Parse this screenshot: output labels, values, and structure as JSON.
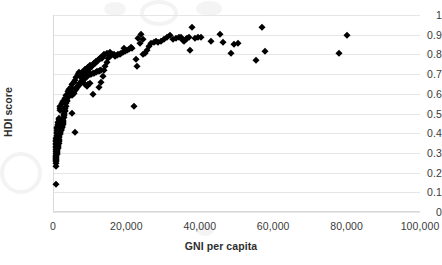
{
  "chart_data": {
    "type": "scatter",
    "title": "",
    "xlabel": "GNI per capita",
    "ylabel": "HDI score",
    "xlim": [
      0,
      100000
    ],
    "ylim": [
      0,
      1
    ],
    "xticks": [
      0,
      20000,
      40000,
      60000,
      80000,
      100000
    ],
    "xticklabels": [
      "0",
      "20,000",
      "40,000",
      "60,000",
      "80,000",
      "100,000"
    ],
    "yticks": [
      0,
      0.1,
      0.2,
      0.3,
      0.4,
      0.5,
      0.6,
      0.7,
      0.8,
      0.9,
      1
    ],
    "yticklabels": [
      "0",
      "0.1",
      "0.2",
      "0.3",
      "0.4",
      "0.5",
      "0.6",
      "0.7",
      "0.8",
      "0.9",
      "1"
    ],
    "grid": "horizontal",
    "legend": null,
    "marker": "diamond",
    "marker_color": "#000000",
    "series": [
      {
        "name": "Countries",
        "points": [
          [
            700,
            0.143
          ],
          [
            760,
            0.235
          ],
          [
            820,
            0.262
          ],
          [
            900,
            0.272
          ],
          [
            950,
            0.285
          ],
          [
            1000,
            0.295
          ],
          [
            1040,
            0.3
          ],
          [
            1080,
            0.305
          ],
          [
            1120,
            0.31
          ],
          [
            1180,
            0.315
          ],
          [
            1220,
            0.32
          ],
          [
            1260,
            0.325
          ],
          [
            1300,
            0.33
          ],
          [
            1350,
            0.333
          ],
          [
            1400,
            0.34
          ],
          [
            1450,
            0.345
          ],
          [
            1500,
            0.352
          ],
          [
            1550,
            0.358
          ],
          [
            1600,
            0.365
          ],
          [
            1650,
            0.372
          ],
          [
            1700,
            0.38
          ],
          [
            1750,
            0.388
          ],
          [
            1800,
            0.395
          ],
          [
            1850,
            0.4
          ],
          [
            1900,
            0.405
          ],
          [
            1950,
            0.408
          ],
          [
            2000,
            0.412
          ],
          [
            2050,
            0.415
          ],
          [
            2100,
            0.418
          ],
          [
            2150,
            0.42
          ],
          [
            2200,
            0.422
          ],
          [
            2250,
            0.425
          ],
          [
            2300,
            0.428
          ],
          [
            2350,
            0.43
          ],
          [
            2400,
            0.433
          ],
          [
            2450,
            0.436
          ],
          [
            2500,
            0.44
          ],
          [
            2550,
            0.444
          ],
          [
            2600,
            0.448
          ],
          [
            2650,
            0.452
          ],
          [
            2700,
            0.458
          ],
          [
            2750,
            0.462
          ],
          [
            2800,
            0.468
          ],
          [
            2850,
            0.475
          ],
          [
            2900,
            0.482
          ],
          [
            2950,
            0.49
          ],
          [
            3000,
            0.498
          ],
          [
            3100,
            0.505
          ],
          [
            3200,
            0.512
          ],
          [
            3300,
            0.52
          ],
          [
            5200,
            0.505
          ],
          [
            6100,
            0.404
          ],
          [
            3400,
            0.528
          ],
          [
            3500,
            0.54
          ],
          [
            3600,
            0.552
          ],
          [
            3700,
            0.562
          ],
          [
            3800,
            0.57
          ],
          [
            3900,
            0.578
          ],
          [
            4000,
            0.584
          ],
          [
            4100,
            0.59
          ],
          [
            4200,
            0.595
          ],
          [
            4300,
            0.6
          ],
          [
            4400,
            0.604
          ],
          [
            4500,
            0.608
          ],
          [
            4600,
            0.61
          ],
          [
            4700,
            0.612
          ],
          [
            4800,
            0.615
          ],
          [
            4900,
            0.618
          ],
          [
            5000,
            0.62
          ],
          [
            5200,
            0.595
          ],
          [
            5400,
            0.6
          ],
          [
            5600,
            0.605
          ],
          [
            5800,
            0.612
          ],
          [
            6000,
            0.618
          ],
          [
            6200,
            0.624
          ],
          [
            6400,
            0.63
          ],
          [
            6600,
            0.636
          ],
          [
            6800,
            0.64
          ],
          [
            7000,
            0.645
          ],
          [
            7200,
            0.65
          ],
          [
            7400,
            0.655
          ],
          [
            7600,
            0.66
          ],
          [
            7800,
            0.664
          ],
          [
            8000,
            0.668
          ],
          [
            8200,
            0.672
          ],
          [
            8400,
            0.676
          ],
          [
            8600,
            0.68
          ],
          [
            8800,
            0.684
          ],
          [
            9000,
            0.688
          ],
          [
            9200,
            0.69
          ],
          [
            9400,
            0.692
          ],
          [
            9600,
            0.695
          ],
          [
            9800,
            0.698
          ],
          [
            10000,
            0.7
          ],
          [
            10400,
            0.702
          ],
          [
            10800,
            0.705
          ],
          [
            11200,
            0.708
          ],
          [
            11600,
            0.712
          ],
          [
            12000,
            0.715
          ],
          [
            12400,
            0.718
          ],
          [
            12800,
            0.72
          ],
          [
            13200,
            0.722
          ],
          [
            11000,
            0.598
          ],
          [
            12600,
            0.635
          ],
          [
            13000,
            0.66
          ],
          [
            13600,
            0.69
          ],
          [
            9200,
            0.64
          ],
          [
            9600,
            0.648
          ],
          [
            10200,
            0.655
          ],
          [
            8600,
            0.65
          ],
          [
            7400,
            0.69
          ],
          [
            7800,
            0.7
          ],
          [
            8200,
            0.706
          ],
          [
            8600,
            0.712
          ],
          [
            9000,
            0.718
          ],
          [
            9400,
            0.722
          ],
          [
            9800,
            0.728
          ],
          [
            10200,
            0.735
          ],
          [
            10600,
            0.742
          ],
          [
            11000,
            0.75
          ],
          [
            11400,
            0.758
          ],
          [
            11800,
            0.764
          ],
          [
            12200,
            0.77
          ],
          [
            12600,
            0.775
          ],
          [
            13000,
            0.78
          ],
          [
            13400,
            0.784
          ],
          [
            13800,
            0.72
          ],
          [
            14200,
            0.74
          ],
          [
            14600,
            0.76
          ],
          [
            15000,
            0.78
          ],
          [
            15400,
            0.79
          ],
          [
            15800,
            0.795
          ],
          [
            16200,
            0.8
          ],
          [
            16600,
            0.802
          ],
          [
            17000,
            0.79
          ],
          [
            17400,
            0.795
          ],
          [
            17800,
            0.8
          ],
          [
            18200,
            0.804
          ],
          [
            18600,
            0.806
          ],
          [
            19000,
            0.81
          ],
          [
            19600,
            0.815
          ],
          [
            20200,
            0.82
          ],
          [
            20800,
            0.825
          ],
          [
            21400,
            0.83
          ],
          [
            22000,
            0.54
          ],
          [
            22600,
            0.775
          ],
          [
            23000,
            0.74
          ],
          [
            23600,
            0.86
          ],
          [
            24000,
            0.905
          ],
          [
            24600,
            0.8
          ],
          [
            25000,
            0.805
          ],
          [
            25600,
            0.82
          ],
          [
            26200,
            0.845
          ],
          [
            26800,
            0.86
          ],
          [
            27400,
            0.862
          ],
          [
            28000,
            0.866
          ],
          [
            28600,
            0.862
          ],
          [
            29400,
            0.87
          ],
          [
            30200,
            0.88
          ],
          [
            31000,
            0.89
          ],
          [
            31800,
            0.896
          ],
          [
            32600,
            0.878
          ],
          [
            33400,
            0.882
          ],
          [
            34200,
            0.886
          ],
          [
            35000,
            0.89
          ],
          [
            35400,
            0.874
          ],
          [
            35800,
            0.87
          ],
          [
            36200,
            0.876
          ],
          [
            36600,
            0.884
          ],
          [
            37000,
            0.888
          ],
          [
            37400,
            0.82
          ],
          [
            37800,
            0.94
          ],
          [
            38600,
            0.884
          ],
          [
            39400,
            0.89
          ],
          [
            40200,
            0.888
          ],
          [
            43000,
            0.866
          ],
          [
            45600,
            0.905
          ],
          [
            46400,
            0.862
          ],
          [
            48400,
            0.806
          ],
          [
            49400,
            0.852
          ],
          [
            50400,
            0.856
          ],
          [
            55400,
            0.774
          ],
          [
            57000,
            0.94
          ],
          [
            57800,
            0.816
          ],
          [
            78000,
            0.806
          ],
          [
            80200,
            0.896
          ],
          [
            21200,
            0.838
          ],
          [
            19400,
            0.83
          ],
          [
            23200,
            0.885
          ],
          [
            24400,
            0.88
          ],
          [
            6800,
            0.7
          ],
          [
            7200,
            0.712
          ],
          [
            6400,
            0.686
          ],
          [
            6000,
            0.672
          ],
          [
            5600,
            0.66
          ],
          [
            5200,
            0.648
          ],
          [
            4800,
            0.636
          ],
          [
            4400,
            0.624
          ],
          [
            4000,
            0.612
          ],
          [
            3600,
            0.594
          ],
          [
            3200,
            0.578
          ],
          [
            2800,
            0.562
          ],
          [
            2400,
            0.552
          ],
          [
            2000,
            0.54
          ],
          [
            1900,
            0.53
          ],
          [
            1800,
            0.52
          ],
          [
            1700,
            0.478
          ],
          [
            1600,
            0.47
          ],
          [
            1500,
            0.462
          ],
          [
            1400,
            0.455
          ],
          [
            1300,
            0.448
          ],
          [
            1250,
            0.44
          ],
          [
            1200,
            0.432
          ],
          [
            1150,
            0.424
          ],
          [
            1100,
            0.416
          ],
          [
            1050,
            0.408
          ],
          [
            1000,
            0.4
          ],
          [
            980,
            0.392
          ],
          [
            960,
            0.384
          ],
          [
            940,
            0.376
          ],
          [
            920,
            0.368
          ],
          [
            900,
            0.36
          ],
          [
            880,
            0.352
          ],
          [
            860,
            0.344
          ],
          [
            840,
            0.336
          ],
          [
            820,
            0.328
          ],
          [
            800,
            0.318
          ],
          [
            790,
            0.308
          ],
          [
            780,
            0.298
          ],
          [
            770,
            0.288
          ],
          [
            760,
            0.278
          ],
          [
            750,
            0.268
          ],
          [
            740,
            0.258
          ],
          [
            730,
            0.248
          ],
          [
            14000,
            0.8
          ],
          [
            14800,
            0.806
          ],
          [
            15600,
            0.812
          ],
          [
            12000,
            0.766
          ],
          [
            11600,
            0.76
          ],
          [
            11200,
            0.754
          ],
          [
            10000,
            0.744
          ],
          [
            9600,
            0.738
          ],
          [
            9200,
            0.732
          ],
          [
            8800,
            0.726
          ],
          [
            8400,
            0.718
          ],
          [
            8000,
            0.71
          ],
          [
            13600,
            0.79
          ],
          [
            13200,
            0.786
          ],
          [
            12800,
            0.782
          ]
        ]
      }
    ]
  },
  "watermarks": [
    {
      "x": 104,
      "y": 2,
      "w": 22,
      "h": 14,
      "kind": "blob"
    },
    {
      "x": 140,
      "y": 0,
      "w": 30,
      "h": 18,
      "kind": "ring"
    },
    {
      "x": 196,
      "y": 1,
      "w": 26,
      "h": 15,
      "kind": "blob"
    },
    {
      "x": 0,
      "y": 152,
      "w": 34,
      "h": 34,
      "kind": "ring"
    },
    {
      "x": 196,
      "y": 224,
      "w": 18,
      "h": 12,
      "kind": "blob"
    }
  ]
}
